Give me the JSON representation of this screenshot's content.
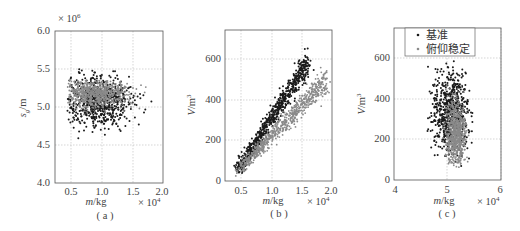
{
  "chart_data": [
    {
      "id": "a",
      "type": "scatter",
      "caption": "( a )",
      "xlabel": "m/kg",
      "ylabel": "s_g/m",
      "x_multiplier": "× 10^4",
      "y_multiplier": "× 10^6",
      "xlim": [
        0.25,
        2.0
      ],
      "ylim": [
        4.0,
        6.0
      ],
      "xticks": [
        "0.5",
        "1.0",
        "1.5",
        "2.0"
      ],
      "yticks": [
        "4.0",
        "4.5",
        "5.0",
        "5.5",
        "6.0"
      ],
      "grid": true,
      "series": [
        {
          "name": "基准",
          "color": "#1a1a1a",
          "cloud": {
            "x_range": [
              0.45,
              1.85
            ],
            "y_range": [
              4.58,
              5.5
            ],
            "center": [
              0.95,
              5.08
            ]
          }
        },
        {
          "name": "俯仰稳定",
          "color": "#8a8a8a",
          "cloud": {
            "x_range": [
              0.45,
              1.9
            ],
            "y_range": [
              4.85,
              5.35
            ],
            "center": [
              0.9,
              5.18
            ]
          }
        }
      ]
    },
    {
      "id": "b",
      "type": "scatter",
      "caption": "( b )",
      "xlabel": "m/kg",
      "ylabel": "V/m^3",
      "x_multiplier": "× 10^4",
      "xlim": [
        0.25,
        2.0
      ],
      "ylim": [
        0,
        750
      ],
      "xticks": [
        "0.5",
        "1.0",
        "1.5",
        "2.0"
      ],
      "yticks": [
        "0",
        "200",
        "400",
        "600"
      ],
      "grid": true,
      "series": [
        {
          "name": "基准",
          "color": "#1a1a1a",
          "trend": {
            "x_start": 0.45,
            "y_start": 50,
            "x_end": 1.6,
            "y_end": 590
          }
        },
        {
          "name": "俯仰稳定",
          "color": "#8a8a8a",
          "trend": {
            "x_start": 0.45,
            "y_start": 50,
            "x_end": 1.9,
            "y_end": 500
          }
        }
      ]
    },
    {
      "id": "c",
      "type": "scatter",
      "caption": "( c )",
      "xlabel": "m/kg",
      "ylabel": "V/m^3",
      "x_multiplier": "× 10^4",
      "xlim": [
        4,
        6
      ],
      "ylim": [
        0,
        750
      ],
      "xticks": [
        "4",
        "5",
        "6"
      ],
      "yticks": [
        "0",
        "200",
        "400",
        "600"
      ],
      "grid": true,
      "legend": {
        "position": "upper-left",
        "entries": [
          "基准",
          "俯仰稳定"
        ]
      },
      "series": [
        {
          "name": "基准",
          "color": "#1a1a1a",
          "cloud": {
            "x_range": [
              4.6,
              5.5
            ],
            "y_range": [
              60,
              590
            ],
            "center": [
              5.05,
              330
            ]
          }
        },
        {
          "name": "俯仰稳定",
          "color": "#8a8a8a",
          "cloud": {
            "x_range": [
              4.9,
              5.4
            ],
            "y_range": [
              60,
              500
            ],
            "center": [
              5.15,
              220
            ]
          }
        }
      ]
    }
  ],
  "legend": {
    "entry1": "基准",
    "entry2": "俯仰稳定"
  },
  "labels": {
    "a": {
      "ylabel_main": "s",
      "ylabel_sub": "g",
      "ylabel_unit": "/m",
      "xlabel_it": "m",
      "xlabel_unit": "/kg",
      "mult_x": "× 10",
      "mult_x_exp": "4",
      "mult_y": "× 10",
      "mult_y_exp": "6",
      "caption": "( a )"
    },
    "b": {
      "ylabel_it": "V",
      "ylabel_unit": "/m",
      "ylabel_exp": "3",
      "xlabel_it": "m",
      "xlabel_unit": "/kg",
      "mult_x": "× 10",
      "mult_x_exp": "4",
      "caption": "( b )"
    },
    "c": {
      "ylabel_it": "V",
      "ylabel_unit": "/m",
      "ylabel_exp": "3",
      "xlabel_it": "m",
      "xlabel_unit": "/kg",
      "mult_x": "× 10",
      "mult_x_exp": "4",
      "caption": "( c )"
    }
  },
  "ticks": {
    "a_x": [
      "0.5",
      "1.0",
      "1.5",
      "2.0"
    ],
    "a_y": [
      "4.0",
      "4.5",
      "5.0",
      "5.5",
      "6.0"
    ],
    "b_x": [
      "0.5",
      "1.0",
      "1.5",
      "2.0"
    ],
    "b_y": [
      "0",
      "200",
      "400",
      "600"
    ],
    "c_x": [
      "4",
      "5",
      "6"
    ],
    "c_y": [
      "0",
      "200",
      "400",
      "600"
    ]
  }
}
